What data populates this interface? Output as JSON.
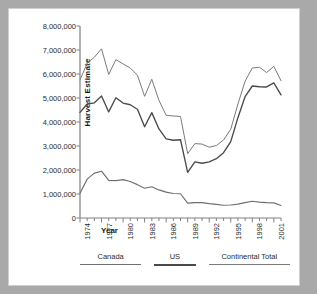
{
  "chart_data": {
    "type": "line",
    "title": "",
    "xlabel": "Year",
    "ylabel": "Harvest Estimate",
    "xlim": [
      1974,
      2002
    ],
    "ylim": [
      0,
      8000000
    ],
    "grid": false,
    "legend_position": "bottom",
    "x": [
      1974,
      1975,
      1976,
      1977,
      1978,
      1979,
      1980,
      1981,
      1982,
      1983,
      1984,
      1985,
      1986,
      1987,
      1988,
      1989,
      1990,
      1991,
      1992,
      1993,
      1994,
      1995,
      1996,
      1997,
      1998,
      1999,
      2000,
      2001,
      2002
    ],
    "xtick_labels": [
      "1974",
      "1977",
      "1980",
      "1983",
      "1986",
      "1989",
      "1992",
      "1995",
      "1998",
      "2001"
    ],
    "xtick_values": [
      1974,
      1977,
      1980,
      1983,
      1986,
      1989,
      1992,
      1995,
      1998,
      2001
    ],
    "ytick_labels": [
      "0",
      "1,000,000",
      "2,000,000",
      "3,000,000",
      "4,000,000",
      "5,000,000",
      "6,000,000",
      "7,000,000",
      "8,000,000"
    ],
    "ytick_values": [
      0,
      1000000,
      2000000,
      3000000,
      4000000,
      5000000,
      6000000,
      7000000,
      8000000
    ],
    "series": [
      {
        "name": "Continental Total",
        "color": "#7b7b7b",
        "width": 1.0,
        "values": [
          5750000,
          6450000,
          6700000,
          7050000,
          5980000,
          6600000,
          6420000,
          6250000,
          5950000,
          5070000,
          5780000,
          4900000,
          4280000,
          4250000,
          4230000,
          2680000,
          3100000,
          3080000,
          2950000,
          3020000,
          3250000,
          3700000,
          4750000,
          5700000,
          6250000,
          6280000,
          6060000,
          6320000,
          5720000
        ]
      },
      {
        "name": "US",
        "color": "#4a4a4a",
        "width": 1.35,
        "values": [
          4400000,
          4750000,
          4800000,
          5080000,
          4420000,
          5010000,
          4790000,
          4720000,
          4530000,
          3800000,
          4390000,
          3710000,
          3300000,
          3240000,
          3260000,
          1900000,
          2340000,
          2280000,
          2340000,
          2470000,
          2720000,
          3180000,
          4180000,
          5060000,
          5500000,
          5470000,
          5460000,
          5630000,
          5130000
        ]
      },
      {
        "name": "Canada",
        "color": "#6f6f6f",
        "width": 1.15,
        "values": [
          1030000,
          1620000,
          1870000,
          1950000,
          1570000,
          1560000,
          1600000,
          1520000,
          1390000,
          1240000,
          1300000,
          1170000,
          1080000,
          1020000,
          1010000,
          620000,
          640000,
          640000,
          600000,
          570000,
          530000,
          540000,
          580000,
          640000,
          700000,
          660000,
          640000,
          630000,
          520000
        ]
      }
    ]
  },
  "legend": {
    "items": [
      {
        "label": "Canada",
        "color": "#6f6f6f",
        "width": 1.6,
        "box": 70
      },
      {
        "label": "US",
        "color": "#4a4a4a",
        "width": 2.1,
        "box": 47
      },
      {
        "label": "Continental Total",
        "color": "#7b7b7b",
        "width": 1.6,
        "box": 93
      }
    ]
  },
  "axis": {
    "line_color": "#808080",
    "tick_color": "#808080"
  }
}
